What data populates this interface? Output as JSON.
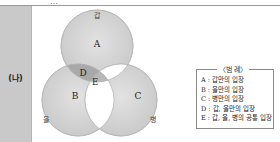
{
  "header": {
    "truncated_text": "…"
  },
  "side": {
    "label": "(나)"
  },
  "diagram": {
    "circles": [
      {
        "id": "gap",
        "label": "갑",
        "cx": 66,
        "cy": 40,
        "r": 36
      },
      {
        "id": "eul",
        "label": "을",
        "cx": 47,
        "cy": 94,
        "r": 36
      },
      {
        "id": "byeong",
        "label": "병",
        "cx": 90,
        "cy": 94,
        "r": 36
      }
    ],
    "regions": [
      {
        "id": "A",
        "label": "A"
      },
      {
        "id": "B",
        "label": "B"
      },
      {
        "id": "C",
        "label": "C"
      },
      {
        "id": "D",
        "label": "D"
      },
      {
        "id": "E",
        "label": "E"
      }
    ],
    "colors": {
      "circle_fill": "#d7d7d7",
      "circle_stroke": "#bdbdbd",
      "overlap_fill": "#a9a9a9",
      "blank_fill": "#ffffff"
    }
  },
  "legend": {
    "title": "〈범 례〉",
    "items": [
      "A : 갑만의 입장",
      "B : 을만의 입장",
      "C : 병만의 입장",
      "D : 갑, 을만의 입장",
      "E : 갑, 을, 병의 공통 입장"
    ]
  }
}
